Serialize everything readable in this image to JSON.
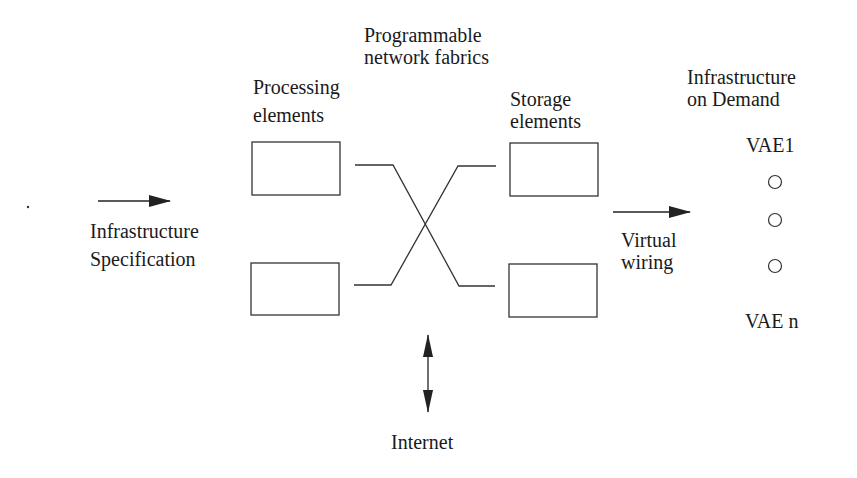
{
  "labels": {
    "fabric_line1": "Programmable",
    "fabric_line2": "network fabrics",
    "processing_line1": "Processing",
    "processing_line2": "elements",
    "storage_line1": "Storage",
    "storage_line2": "elements",
    "spec_line1": "Infrastructure",
    "spec_line2": "Specification",
    "wiring_line1": "Virtual",
    "wiring_line2": "wiring",
    "demand_line1": "Infrastructure",
    "demand_line2": "on Demand",
    "vae_first": "VAE1",
    "vae_last": "VAE n",
    "internet": "Internet"
  },
  "colors": {
    "stroke": "#333333",
    "text": "#1a1a1a",
    "background": "#ffffff"
  }
}
